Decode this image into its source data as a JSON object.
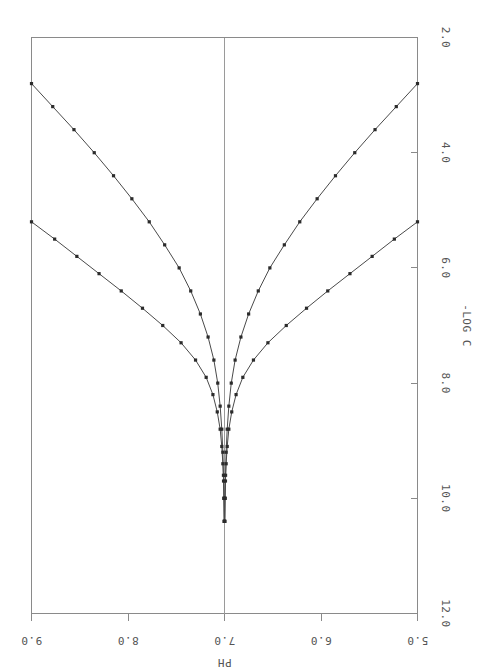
{
  "chart_data": {
    "type": "line",
    "title": "",
    "xlabel": "-LOG C",
    "ylabel": "PH",
    "orientation": "rotated-90",
    "grid": false,
    "legend": null,
    "xlim": [
      2.0,
      12.0
    ],
    "ylim": [
      5.0,
      9.0
    ],
    "xticks": [
      "2.0",
      "4.0",
      "6.0",
      "8.0",
      "10.0",
      "12.0"
    ],
    "xtick_values": [
      2.0,
      4.0,
      6.0,
      8.0,
      10.0,
      12.0
    ],
    "yticks": [
      "9.0",
      "8.0",
      "7.0",
      "6.0",
      "5.0"
    ],
    "ytick_values": [
      9.0,
      8.0,
      7.0,
      6.0,
      5.0
    ],
    "reference_line": {
      "axis": "ph",
      "value": 7.0,
      "style": "solid"
    },
    "series": [
      {
        "name": "strong base dilution",
        "marker": "square",
        "points": [
          [
            2.8,
            9.0
          ],
          [
            3.2,
            8.78
          ],
          [
            3.6,
            8.56
          ],
          [
            4.0,
            8.35
          ],
          [
            4.4,
            8.15
          ],
          [
            4.8,
            7.96
          ],
          [
            5.2,
            7.78
          ],
          [
            5.6,
            7.62
          ],
          [
            6.0,
            7.47
          ],
          [
            6.4,
            7.35
          ],
          [
            6.8,
            7.25
          ],
          [
            7.2,
            7.17
          ],
          [
            7.6,
            7.11
          ],
          [
            8.0,
            7.07
          ],
          [
            8.4,
            7.045
          ],
          [
            8.8,
            7.028
          ],
          [
            9.2,
            7.017
          ],
          [
            9.6,
            7.011
          ],
          [
            10.0,
            7.006
          ],
          [
            10.4,
            7.003
          ]
        ]
      },
      {
        "name": "weak base dilution",
        "marker": "square",
        "points": [
          [
            5.2,
            9.0
          ],
          [
            5.5,
            8.76
          ],
          [
            5.8,
            8.53
          ],
          [
            6.1,
            8.3
          ],
          [
            6.4,
            8.07
          ],
          [
            6.7,
            7.85
          ],
          [
            7.0,
            7.64
          ],
          [
            7.3,
            7.45
          ],
          [
            7.6,
            7.3
          ],
          [
            7.9,
            7.19
          ],
          [
            8.2,
            7.12
          ],
          [
            8.5,
            7.075
          ],
          [
            8.8,
            7.045
          ],
          [
            9.1,
            7.028
          ],
          [
            9.4,
            7.017
          ],
          [
            9.7,
            7.01
          ],
          [
            10.0,
            7.006
          ],
          [
            10.4,
            7.003
          ]
        ]
      },
      {
        "name": "weak acid dilution",
        "marker": "square",
        "points": [
          [
            5.2,
            5.0
          ],
          [
            5.5,
            5.24
          ],
          [
            5.8,
            5.47
          ],
          [
            6.1,
            5.7
          ],
          [
            6.4,
            5.93
          ],
          [
            6.7,
            6.15
          ],
          [
            7.0,
            6.36
          ],
          [
            7.3,
            6.55
          ],
          [
            7.6,
            6.7
          ],
          [
            7.9,
            6.81
          ],
          [
            8.2,
            6.88
          ],
          [
            8.5,
            6.925
          ],
          [
            8.8,
            6.955
          ],
          [
            9.1,
            6.972
          ],
          [
            9.4,
            6.983
          ],
          [
            9.7,
            6.99
          ],
          [
            10.0,
            6.994
          ],
          [
            10.4,
            6.997
          ]
        ]
      },
      {
        "name": "strong acid dilution",
        "marker": "square",
        "points": [
          [
            2.8,
            5.0
          ],
          [
            3.2,
            5.22
          ],
          [
            3.6,
            5.44
          ],
          [
            4.0,
            5.65
          ],
          [
            4.4,
            5.85
          ],
          [
            4.8,
            6.04
          ],
          [
            5.2,
            6.22
          ],
          [
            5.6,
            6.38
          ],
          [
            6.0,
            6.53
          ],
          [
            6.4,
            6.65
          ],
          [
            6.8,
            6.75
          ],
          [
            7.2,
            6.83
          ],
          [
            7.6,
            6.89
          ],
          [
            8.0,
            6.93
          ],
          [
            8.4,
            6.955
          ],
          [
            8.8,
            6.972
          ],
          [
            9.2,
            6.983
          ],
          [
            9.6,
            6.989
          ],
          [
            10.0,
            6.994
          ],
          [
            10.4,
            6.997
          ]
        ]
      }
    ]
  },
  "axes": {
    "x_axis_title": "-LOG C",
    "y_axis_title": "PH"
  },
  "colors": {
    "frame": "#8a8a8a",
    "curve": "#4a4a4a",
    "marker": "#2b2b2b",
    "text": "#555555",
    "background": "#ffffff"
  }
}
